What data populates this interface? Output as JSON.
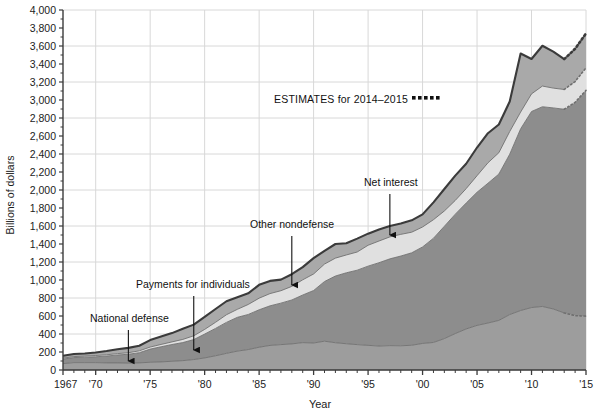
{
  "chart_data": {
    "type": "area",
    "title": "",
    "xlabel": "Year",
    "ylabel": "Billions of dollars",
    "xlim": [
      1967,
      2015
    ],
    "ylim": [
      0,
      4000
    ],
    "y_tick_step": 200,
    "grid": true,
    "legend": "annotations",
    "estimates_note": "ESTIMATES for 2014–2015",
    "estimates_years": [
      2014,
      2015
    ],
    "y_ticks": [
      "0",
      "200",
      "400",
      "600",
      "800",
      "1,000",
      "1,200",
      "1,400",
      "1,600",
      "1,800",
      "2,000",
      "2,200",
      "2,400",
      "2,600",
      "2,800",
      "3,000",
      "3,200",
      "3,400",
      "3,600",
      "3,800",
      "4,000"
    ],
    "x_ticks": [
      "1967",
      "'70",
      "'75",
      "'80",
      "'85",
      "'90",
      "'95",
      "'00",
      "'05",
      "'10",
      "'15"
    ],
    "x_tick_years": [
      1967,
      1970,
      1975,
      1980,
      1985,
      1990,
      1995,
      2000,
      2005,
      2010,
      2015
    ],
    "x": [
      1967,
      1968,
      1969,
      1970,
      1971,
      1972,
      1973,
      1974,
      1975,
      1976,
      1977,
      1978,
      1979,
      1980,
      1981,
      1982,
      1983,
      1984,
      1985,
      1986,
      1987,
      1988,
      1989,
      1990,
      1991,
      1992,
      1993,
      1994,
      1995,
      1996,
      1997,
      1998,
      1999,
      2000,
      2001,
      2002,
      2003,
      2004,
      2005,
      2006,
      2007,
      2008,
      2009,
      2010,
      2011,
      2012,
      2013,
      2014,
      2015
    ],
    "series": [
      {
        "name": "National defense",
        "color": "#9d9d9d",
        "values": [
          71,
          82,
          82,
          82,
          79,
          79,
          77,
          79,
          86,
          90,
          97,
          104,
          116,
          134,
          158,
          185,
          210,
          227,
          253,
          273,
          282,
          290,
          304,
          300,
          320,
          303,
          292,
          282,
          274,
          266,
          271,
          269,
          275,
          295,
          306,
          349,
          405,
          456,
          496,
          522,
          551,
          616,
          661,
          694,
          706,
          678,
          634,
          604,
          598
        ]
      },
      {
        "name": "Payments for individuals",
        "color": "#8d8d8d",
        "values": [
          50,
          56,
          60,
          65,
          76,
          88,
          98,
          113,
          146,
          168,
          186,
          201,
          222,
          265,
          304,
          344,
          375,
          390,
          416,
          440,
          461,
          488,
          529,
          583,
          663,
          741,
          788,
          827,
          880,
          926,
          964,
          997,
          1027,
          1072,
          1158,
          1248,
          1326,
          1399,
          1479,
          1553,
          1626,
          1782,
          2019,
          2178,
          2219,
          2234,
          2263,
          2370,
          2509
        ]
      },
      {
        "name": "Net interest",
        "color": "#e0e0e0",
        "values": [
          10,
          11,
          12,
          14,
          14,
          15,
          17,
          21,
          23,
          26,
          29,
          35,
          42,
          52,
          68,
          85,
          89,
          111,
          129,
          136,
          138,
          151,
          169,
          184,
          194,
          199,
          198,
          202,
          232,
          241,
          244,
          241,
          229,
          222,
          206,
          170,
          153,
          160,
          184,
          227,
          237,
          252,
          186,
          196,
          230,
          220,
          220,
          231,
          251
        ]
      },
      {
        "name": "Other nondefense",
        "color": "#a9a9a9",
        "values": [
          27,
          29,
          30,
          34,
          42,
          48,
          54,
          56,
          77,
          87,
          98,
          119,
          124,
          139,
          148,
          150,
          135,
          124,
          148,
          141,
          123,
          135,
          141,
          176,
          147,
          157,
          131,
          149,
          129,
          128,
          122,
          120,
          132,
          140,
          193,
          244,
          276,
          277,
          313,
          329,
          314,
          333,
          651,
          388,
          448,
          405,
          337,
          364,
          382
        ]
      }
    ],
    "annotations": [
      {
        "label": "National defense",
        "text_x": 90,
        "text_y": 322,
        "year": 1973,
        "arrow_from_y": 330,
        "arrow_to_y": 366
      },
      {
        "label": "Payments for individuals",
        "text_x": 136,
        "text_y": 288,
        "year": 1979,
        "arrow_from_y": 296,
        "arrow_to_y": 355
      },
      {
        "label": "Other nondefense",
        "text_x": 250,
        "text_y": 228,
        "year": 1988,
        "arrow_from_y": 236,
        "arrow_to_y": 290
      },
      {
        "label": "Net interest",
        "text_x": 364,
        "text_y": 186,
        "year": 1997,
        "arrow_from_y": 194,
        "arrow_to_y": 240
      }
    ]
  },
  "colors": {
    "national_defense": "#9d9d9d",
    "payments_for_individuals": "#8d8d8d",
    "net_interest": "#e0e0e0",
    "other_nondefense": "#a9a9a9",
    "outline": "#3b3b3b",
    "grid": "#d8d8d8",
    "axis": "#3b3b3b",
    "text": "#1c1c1c"
  },
  "plot": {
    "left": 63,
    "right": 586,
    "top": 10,
    "bottom": 370
  }
}
